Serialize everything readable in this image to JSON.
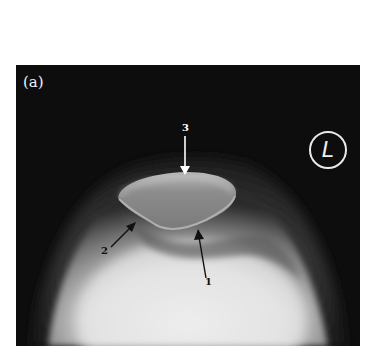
{
  "figure": {
    "panel_label": "(a)",
    "side_marker": "L",
    "annotations": [
      {
        "id": "1",
        "label": "1",
        "arrow_color": "#111111",
        "direction": "up"
      },
      {
        "id": "2",
        "label": "2",
        "arrow_color": "#111111",
        "direction": "up-right"
      },
      {
        "id": "3",
        "label": "3",
        "arrow_color": "#ffffff",
        "direction": "down"
      }
    ],
    "colors": {
      "background": "#0d0d0d",
      "page": "#ffffff",
      "bone_light": "#e9e9e9",
      "bone_mid": "#9a9a9a"
    }
  }
}
